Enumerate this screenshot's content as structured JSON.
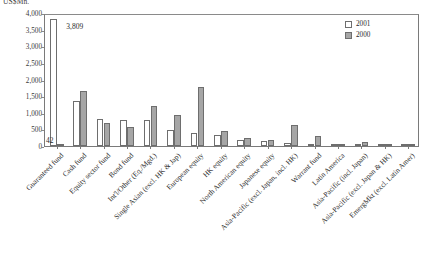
{
  "axis": {
    "unit_title": "US$Mn.",
    "y_ticks": [
      "4,000",
      "3,500",
      "3,000",
      "2,500",
      "2,000",
      "1,500",
      "1,000",
      "500",
      "0"
    ],
    "ylabel": "",
    "xlabel": ""
  },
  "legend": {
    "position": "top-right",
    "entries": [
      {
        "label": "2001",
        "color": "#ffffff"
      },
      {
        "label": "2000",
        "color": "#a6a6a6"
      }
    ]
  },
  "annotations": [
    {
      "text": "3,809",
      "series": "2001",
      "category": "Guaranteed fund"
    },
    {
      "text": "42",
      "series": "2000",
      "category": "Guaranteed fund"
    }
  ],
  "chart_data": {
    "type": "bar",
    "title": "",
    "subtitle": "",
    "xlabel": "",
    "ylabel": "US$Mn.",
    "ylim": [
      0,
      4000
    ],
    "ytick_step": 500,
    "grid": false,
    "legend_position": "top-right",
    "categories": [
      "Guaranteed fund",
      "Cash fund",
      "Equity sector fund",
      "Bond fund",
      "Int'l/Other (Eq./Mgd.)",
      "Single Asian (excl. HK & Jap)",
      "European equity",
      "HK equity",
      "North American equity",
      "Japanese equity",
      "Asia-Pacific (excl. Japan, incl. HK)",
      "Warrant fund",
      "Latin America",
      "Asia-Pacific (incl. Japan)",
      "Asia-Pacific (excl. Japan & HK)",
      "EmergMkt (excl. Latin Amer)"
    ],
    "series": [
      {
        "name": "2001",
        "color": "#ffffff",
        "values": [
          3809,
          1350,
          820,
          790,
          770,
          480,
          380,
          340,
          170,
          140,
          100,
          60,
          25,
          15,
          10,
          5
        ]
      },
      {
        "name": "2000",
        "color": "#a6a6a6",
        "values": [
          42,
          1640,
          700,
          580,
          1190,
          940,
          1760,
          440,
          240,
          175,
          620,
          310,
          30,
          130,
          12,
          8
        ]
      }
    ]
  }
}
